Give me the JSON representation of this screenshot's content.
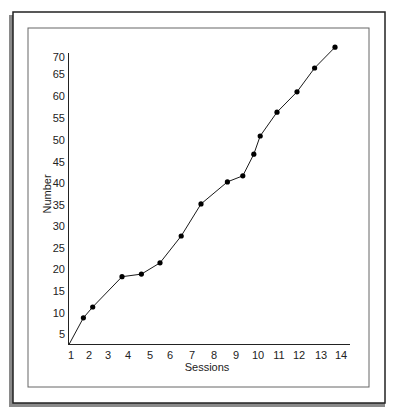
{
  "chart_data": {
    "type": "line",
    "title": "",
    "xlabel": "Sessions",
    "ylabel": "Number",
    "x_ticks": [
      "1",
      "2",
      "3",
      "4",
      "5",
      "6",
      "7",
      "8",
      "9",
      "10",
      "11",
      "12",
      "13",
      "14"
    ],
    "y_ticks": [
      "5",
      "10",
      "15",
      "20",
      "25",
      "30",
      "35",
      "40",
      "45",
      "50",
      "55",
      "60",
      "65",
      "70"
    ],
    "xlim": [
      1,
      14
    ],
    "ylim": [
      2,
      70
    ],
    "grid": false,
    "legend": null,
    "series": [
      {
        "name": "Number",
        "markers": true,
        "x": [
          1,
          1.8,
          2.3,
          3.8,
          4.7,
          5.6,
          6.6,
          7.5,
          8.7,
          9.4,
          9.9,
          10.2,
          11.0,
          12.0,
          12.8,
          13.8
        ],
        "values": [
          2,
          8.5,
          11,
          18,
          18.6,
          21.2,
          27.4,
          34.8,
          39.9,
          41.3,
          46.3,
          50.5,
          56,
          60.7,
          66.2,
          71
        ],
        "marker_at_start": false
      }
    ]
  },
  "colors": {
    "line": "#1a1a1a",
    "marker": "#000000",
    "frame": "#222222",
    "inner_frame": "#555555",
    "shadow": "#777777"
  }
}
